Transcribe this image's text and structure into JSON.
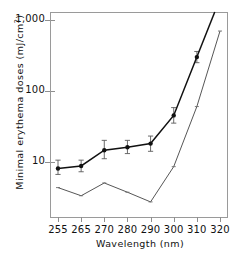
{
  "chart_data": {
    "type": "line",
    "title": "",
    "xlabel": "Wavelength  (nm)",
    "ylabel": "Minimal erythema doses  (mJ/cm²)",
    "ylabel_main": "Minimal erythema doses  (mJ/cm",
    "ylabel_exp": "2",
    "ylabel_tail": ")",
    "x_axis_type": "categorical-evenly-spaced",
    "categories": [
      255,
      265,
      270,
      280,
      290,
      300,
      310,
      320
    ],
    "xtick_labels": [
      "255",
      "265",
      "270",
      "280",
      "290",
      "300",
      "310",
      "320"
    ],
    "yscale": "log",
    "ylim": [
      1.6,
      1300
    ],
    "ytick_values": [
      10,
      100,
      1000
    ],
    "ytick_labels": [
      "10",
      "100",
      "1,000"
    ],
    "grid": false,
    "legend": "none",
    "series": [
      {
        "name": "upper-curve-filled-circles",
        "marker": "filled-circle",
        "error_bars": true,
        "x": [
          255,
          265,
          270,
          280,
          290,
          300,
          310
        ],
        "values": [
          8.0,
          8.7,
          14.5,
          16.0,
          18.0,
          45.0,
          300.0
        ],
        "err_low": [
          6.6,
          7.2,
          11.0,
          13.0,
          14.0,
          35.0,
          250.0
        ],
        "err_high": [
          10.5,
          10.5,
          20.0,
          20.0,
          23.0,
          58.0,
          360.0
        ]
      },
      {
        "name": "lower-curve-thin-line",
        "marker": "small-tick",
        "error_bars": false,
        "x": [
          255,
          265,
          270,
          280,
          290,
          300,
          310,
          320
        ],
        "values": [
          4.3,
          3.3,
          5.0,
          3.7,
          2.7,
          8.5,
          60.0,
          700.0
        ]
      }
    ]
  }
}
